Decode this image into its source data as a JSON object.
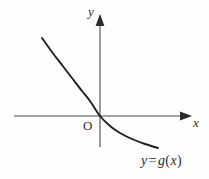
{
  "figure": {
    "background_color": "#fefefe",
    "ink_color": "#2b2b2b",
    "curve_color": "#1f1f1f",
    "axis_color": "#4a4a4a",
    "width": 209,
    "height": 179
  },
  "labels": {
    "y_axis": "y",
    "x_axis": "x",
    "origin": "O",
    "function_lhs": "y",
    "function_equals": "=",
    "function_name": "g",
    "function_open_paren": "(",
    "function_arg": "x",
    "function_close_paren": ")",
    "function_full": "y = g(x)"
  },
  "chart_data": {
    "type": "line",
    "title": "",
    "subtitle": "",
    "xlabel": "x",
    "ylabel": "y",
    "grid": false,
    "legend": "none",
    "annotations": [
      {
        "text": "O",
        "meaning": "origin-marker",
        "x": 0,
        "y": 0
      },
      {
        "text": "y = g(x)",
        "meaning": "curve-label",
        "position": "lower-right"
      }
    ],
    "axes": {
      "x_axis_pixel_y": 116,
      "y_axis_pixel_x": 100,
      "x_axis_pixel_start": 14,
      "x_axis_pixel_end": 192,
      "y_axis_pixel_top": 14,
      "y_axis_pixel_bottom": 147,
      "x_arrow": true,
      "y_arrow": true,
      "ticks": [],
      "tick_labels": []
    },
    "series": [
      {
        "name": "y = g(x)",
        "description": "decreasing convex curve passing through the origin",
        "points_pixel": [
          [
            42,
            38
          ],
          [
            52,
            52
          ],
          [
            62,
            65
          ],
          [
            72,
            78
          ],
          [
            82,
            91
          ],
          [
            90,
            101
          ],
          [
            100,
            116
          ],
          [
            110,
            126
          ],
          [
            120,
            133
          ],
          [
            132,
            139
          ],
          [
            145,
            144
          ],
          [
            158,
            148
          ]
        ],
        "points_data": [
          [
            -2.9,
            3.9
          ],
          [
            -2.4,
            3.2
          ],
          [
            -1.9,
            2.55
          ],
          [
            -1.4,
            1.9
          ],
          [
            -0.9,
            1.25
          ],
          [
            -0.5,
            0.75
          ],
          [
            0,
            0
          ],
          [
            0.5,
            -0.5
          ],
          [
            1.0,
            -0.85
          ],
          [
            1.6,
            -1.15
          ],
          [
            2.25,
            -1.4
          ],
          [
            2.9,
            -1.6
          ]
        ]
      }
    ],
    "xlim": [
      -4.3,
      4.6
    ],
    "ylim": [
      -3.1,
      5.1
    ]
  }
}
